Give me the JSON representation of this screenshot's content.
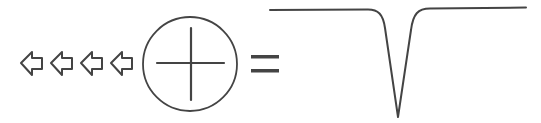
{
  "diagram": {
    "stroke_color": "#444444",
    "background_color": "#ffffff",
    "arrows": {
      "count": 4,
      "direction": "left",
      "style": "outline",
      "icon": "arrow-left-outline-icon"
    },
    "operator_symbol": {
      "icon": "circle-cross-icon",
      "shape": "circle with plus cross"
    },
    "equals_symbol": {
      "icon": "equals-icon",
      "glyph": "="
    },
    "result_waveform": {
      "icon": "negative-spike-waveform-icon",
      "shape": "flat baseline with single sharp downward V-shaped dip"
    }
  }
}
